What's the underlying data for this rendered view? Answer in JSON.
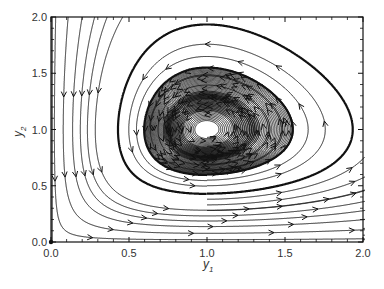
{
  "chart_data": {
    "type": "line",
    "subtype": "phase-portrait-streamplot",
    "title": "",
    "xlabel": "y",
    "xlabel_subscript": "1",
    "ylabel": "y",
    "ylabel_subscript": "2",
    "xlim": [
      0.0,
      2.0
    ],
    "ylim": [
      0.0,
      2.0
    ],
    "xticks": [
      "0.0",
      "0.5",
      "1.0",
      "1.5",
      "2.0"
    ],
    "yticks": [
      "0.0",
      "0.5",
      "1.0",
      "1.5",
      "2.0"
    ],
    "xtick_values": [
      0.0,
      0.5,
      1.0,
      1.5,
      2.0
    ],
    "ytick_values": [
      0.0,
      0.5,
      1.0,
      1.5,
      2.0
    ],
    "minor_ticks_per_interval": 4,
    "grid": false,
    "legend": "none",
    "system": "Lotka-Volterra: dy1/dt = y1(1 - y2), dy2/dt = y2(y1 - 1)",
    "equilibrium": [
      1.0,
      1.0
    ],
    "flow_direction": "counter-clockwise",
    "stream_color": "#111111",
    "highlighted_orbits": [
      {
        "name": "outer-orbit",
        "through_point": [
          1.0,
          0.43
        ],
        "emphasis": "bold"
      },
      {
        "name": "inner-orbit",
        "through_point": [
          1.0,
          0.6
        ],
        "emphasis": "bold"
      }
    ],
    "closed_orbits_through_y1_1": [
      0.93,
      0.85,
      0.77,
      0.69,
      0.64,
      0.55,
      0.5,
      0.38,
      0.33,
      0.28
    ],
    "open_streamlines_start_y1": [
      0.03,
      0.11,
      0.2,
      0.28,
      0.36,
      0.46
    ]
  }
}
